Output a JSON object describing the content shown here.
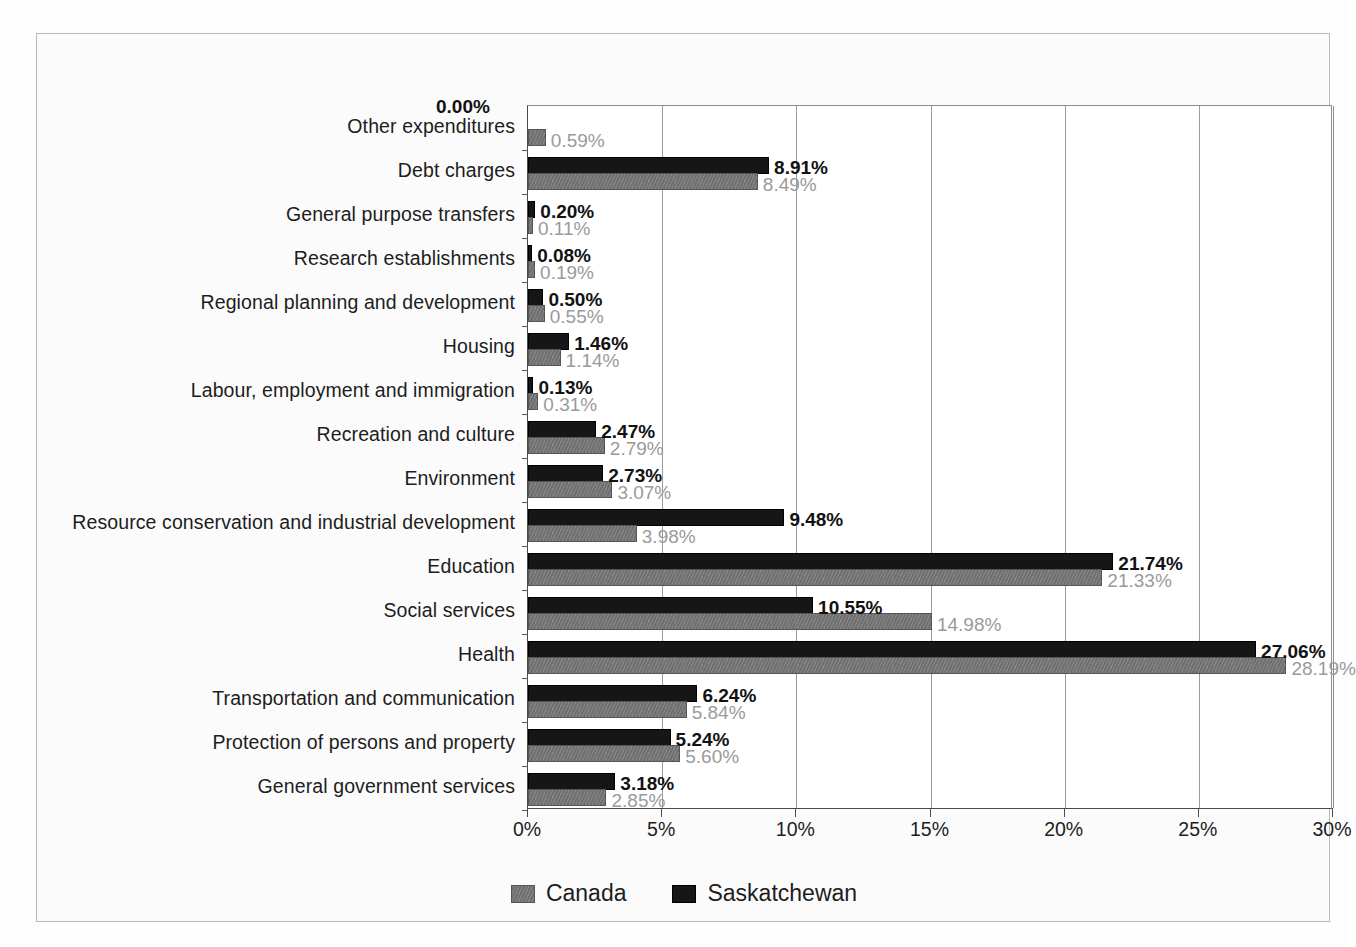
{
  "chart_data": {
    "type": "bar",
    "orientation": "horizontal",
    "title": "",
    "xlabel": "",
    "ylabel": "",
    "xlim": [
      0,
      30
    ],
    "xtick_labels": [
      "0%",
      "5%",
      "10%",
      "15%",
      "20%",
      "25%",
      "30%"
    ],
    "xticks": [
      0,
      5,
      10,
      15,
      20,
      25,
      30
    ],
    "grid": true,
    "grid_axis": "x",
    "legend_position": "bottom",
    "value_suffix": "%",
    "categories": [
      "Other expenditures",
      "Debt charges",
      "General purpose transfers",
      "Research establishments",
      "Regional planning and development",
      "Housing",
      "Labour, employment and immigration",
      "Recreation and culture",
      "Environment",
      "Resource conservation and industrial development",
      "Education",
      "Social services",
      "Health",
      "Transportation and communication",
      "Protection of persons and property",
      "General government services"
    ],
    "series": [
      {
        "name": "Saskatchewan",
        "color": "#161616",
        "values": [
          0.0,
          8.91,
          0.2,
          0.08,
          0.5,
          1.46,
          0.13,
          2.47,
          2.73,
          9.48,
          21.74,
          10.55,
          27.06,
          6.24,
          5.24,
          3.18
        ],
        "labels": [
          "0.00%",
          "8.91%",
          "0.20%",
          "0.08%",
          "0.50%",
          "1.46%",
          "0.13%",
          "2.47%",
          "2.73%",
          "9.48%",
          "21.74%",
          "10.55%",
          "27.06%",
          "6.24%",
          "5.24%",
          "3.18%"
        ]
      },
      {
        "name": "Canada",
        "color": "#707070",
        "values": [
          0.59,
          8.49,
          0.11,
          0.19,
          0.55,
          1.14,
          0.31,
          2.79,
          3.07,
          3.98,
          21.33,
          14.98,
          28.19,
          5.84,
          5.6,
          2.85
        ],
        "labels": [
          "0.59%",
          "8.49%",
          "0.11%",
          "0.19%",
          "0.55%",
          "1.14%",
          "0.31%",
          "2.79%",
          "3.07%",
          "3.98%",
          "21.33%",
          "14.98%",
          "28.19%",
          "5.84%",
          "5.60%",
          "2.85%"
        ]
      }
    ]
  },
  "legend": {
    "items": [
      {
        "label": "Canada",
        "swatch": "canada-swatch"
      },
      {
        "label": "Saskatchewan",
        "swatch": "saskatchewan-swatch"
      }
    ]
  }
}
